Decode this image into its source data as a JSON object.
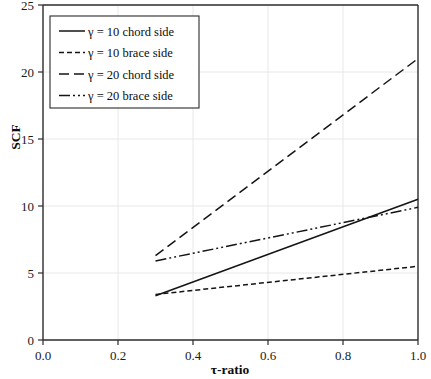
{
  "chart_data": {
    "type": "line",
    "title": "",
    "xlabel": "τ-ratio",
    "ylabel": "SCF",
    "xlim": [
      0.0,
      1.0
    ],
    "ylim": [
      0,
      25
    ],
    "grid": true,
    "legend_position": "top-left",
    "xticks": [
      "0.0",
      "0.2",
      "0.4",
      "0.6",
      "0.8",
      "1.0"
    ],
    "xtick_values": [
      0.0,
      0.2,
      0.4,
      0.6,
      0.8,
      1.0
    ],
    "yticks": [
      "0",
      "5",
      "10",
      "15",
      "20",
      "25"
    ],
    "ytick_values": [
      0,
      5,
      10,
      15,
      20,
      25
    ],
    "x": [
      0.3,
      1.0
    ],
    "series": [
      {
        "name": "γ = 10 chord side",
        "style": "solid",
        "dasharray": "",
        "x": [
          0.3,
          1.0
        ],
        "values": [
          3.3,
          10.5
        ]
      },
      {
        "name": "γ = 10 brace side",
        "style": "dashed-short",
        "dasharray": "5,3",
        "x": [
          0.3,
          1.0
        ],
        "values": [
          3.4,
          5.5
        ]
      },
      {
        "name": "γ = 20 chord side",
        "style": "dashed-long",
        "dasharray": "10,5",
        "x": [
          0.3,
          1.0
        ],
        "values": [
          6.3,
          21.0
        ]
      },
      {
        "name": "γ = 20 brace side",
        "style": "dash-dot",
        "dasharray": "11,3,2,3,2,3",
        "x": [
          0.3,
          1.0
        ],
        "values": [
          5.9,
          9.9
        ]
      }
    ]
  },
  "axes": {
    "y_title": "SCF",
    "x_title": "τ-ratio"
  },
  "legend": {
    "entries": [
      {
        "label": "γ = 10 chord side"
      },
      {
        "label": "γ = 10 brace side"
      },
      {
        "label": "γ = 20 chord side"
      },
      {
        "label": "γ = 20 brace side"
      }
    ]
  }
}
